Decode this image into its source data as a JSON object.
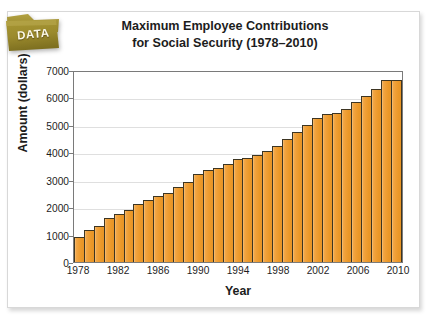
{
  "badge": {
    "label": "DATA",
    "icon": "folder-tab-icon",
    "color": "#9a8a33"
  },
  "card": {
    "background": "#ffffff",
    "border": "#d8d8d8"
  },
  "chart_data": {
    "type": "bar",
    "title": "Maximum Employee Contributions for Social Security (1978–2010)",
    "title_line1": "Maximum Employee Contributions",
    "title_line2": "for Social Security (1978–2010)",
    "xlabel": "Year",
    "ylabel": "Amount (dollars)",
    "ylim": [
      0,
      7000
    ],
    "ytick_step": 1000,
    "yticks": [
      0,
      1000,
      2000,
      3000,
      4000,
      5000,
      6000,
      7000
    ],
    "ytick_labels": [
      "0",
      "1000",
      "2000",
      "3000",
      "4000",
      "5000",
      "6000",
      "7000"
    ],
    "xtick_labels": [
      "1978",
      "1982",
      "1986",
      "1990",
      "1994",
      "1998",
      "2002",
      "2006",
      "2010"
    ],
    "xtick_years": [
      1978,
      1982,
      1986,
      1990,
      1994,
      1998,
      2002,
      2006,
      2010
    ],
    "grid": true,
    "grid_axis": "y",
    "legend": false,
    "bar_color": "#ef9e34",
    "bar_edge_color": "#3d3522",
    "categories": [
      "1978",
      "1979",
      "1980",
      "1981",
      "1982",
      "1983",
      "1984",
      "1985",
      "1986",
      "1987",
      "1988",
      "1989",
      "1990",
      "1991",
      "1992",
      "1993",
      "1994",
      "1995",
      "1996",
      "1997",
      "1998",
      "1999",
      "2000",
      "2001",
      "2002",
      "2003",
      "2004",
      "2005",
      "2006",
      "2007",
      "2008",
      "2009",
      "2010"
    ],
    "values": [
      930,
      1171,
      1330,
      1588,
      1760,
      1898,
      2133,
      2272,
      2392,
      2511,
      2738,
      2915,
      3206,
      3357,
      3441,
      3571,
      3757,
      3808,
      3888,
      4056,
      4241,
      4501,
      4725,
      4985,
      5263,
      5394,
      5450,
      5581,
      5841,
      6045,
      6324,
      6622,
      6622
    ],
    "units": "dollars"
  }
}
